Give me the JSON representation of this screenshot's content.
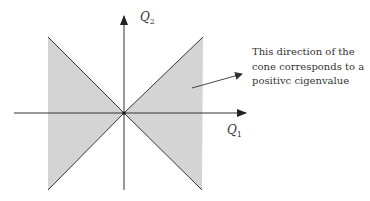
{
  "diagram": {
    "title": "",
    "axes": {
      "horizontal": {
        "label": "Q",
        "subscript": "1"
      },
      "vertical": {
        "label": "Q",
        "subscript": "2"
      }
    },
    "annotation": {
      "lines": [
        "This direction of the",
        "cone corresponds to a",
        "positivc cigenvalue"
      ]
    },
    "colors": {
      "shade": "#d4d4d4",
      "line": "#333333",
      "background": "#ffffff"
    },
    "shape": "double cone (bowtie) opening left and right from origin"
  }
}
